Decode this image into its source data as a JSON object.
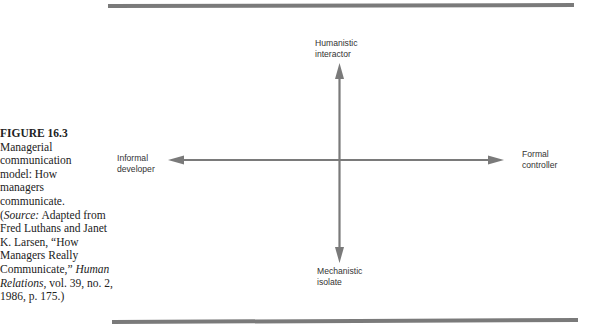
{
  "figure": {
    "number_label": "FIGURE 16.3",
    "title_lines": [
      "Managerial",
      "communication",
      "model: How",
      "managers",
      "communicate."
    ],
    "source": {
      "open_paren": "(",
      "source_label": "Source:",
      "text1": " Adapted from Fred Luthans and Janet K. Larsen, “How Managers Really Communicate,” ",
      "journal": "Human Relations,",
      "text2": " vol. 39, no. 2, 1986, p. 175.)"
    }
  },
  "diagram": {
    "axis_color": "#7a7a7a",
    "rule_color": "#7a7a7a",
    "labels": {
      "top": [
        "Humanistic",
        "interactor"
      ],
      "bottom": [
        "Mechanistic",
        "isolate"
      ],
      "left": [
        "Informal",
        "developer"
      ],
      "right": [
        "Formal",
        "controller"
      ]
    }
  }
}
